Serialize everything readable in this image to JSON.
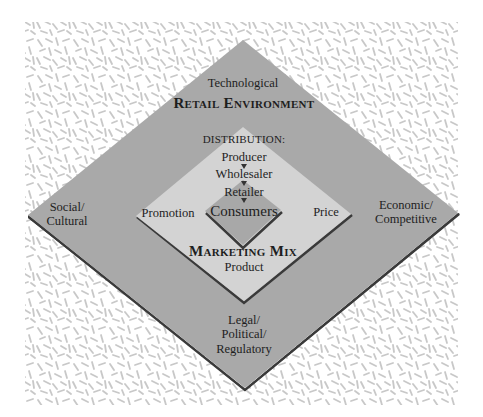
{
  "diagram": {
    "outer": {
      "title": "Retail Environment",
      "labels": {
        "top": "Technological",
        "left_line1": "Social/",
        "left_line2": "Cultural",
        "right_line1": "Economic/",
        "right_line2": "Competitive",
        "bottom_line1": "Legal/",
        "bottom_line2": "Political/",
        "bottom_line3": "Regulatory"
      }
    },
    "middle": {
      "title": "Marketing Mix",
      "labels": {
        "left": "Promotion",
        "right": "Price",
        "bottom": "Product"
      },
      "distribution": {
        "heading": "DISTRIBUTION:",
        "steps": [
          "Producer",
          "Wholesaler",
          "Retailer"
        ]
      }
    },
    "inner": {
      "label": "Consumers"
    },
    "colors": {
      "background": "#ffffff",
      "texture": "#c8c8c8",
      "outer_fill": "#a9a9a9",
      "middle_fill": "#d3d3d3",
      "inner_fill": "#a8a8a8",
      "shadow": "#3a3a3a",
      "text": "#1e1e1e"
    }
  }
}
